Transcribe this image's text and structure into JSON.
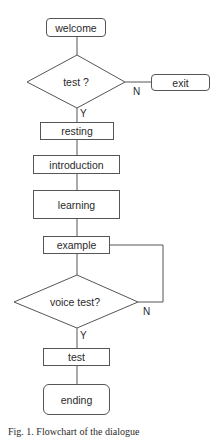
{
  "flowchart": {
    "nodes": {
      "welcome": "welcome",
      "test_decision": "test ?",
      "exit": "exit",
      "resting": "resting",
      "introduction": "introduction",
      "learning": "learning",
      "example": "example",
      "voice_test_decision": "voice test?",
      "test": "test",
      "ending": "ending"
    },
    "edge_labels": {
      "test_no": "N",
      "test_yes": "Y",
      "voice_no": "N",
      "voice_yes": "Y"
    },
    "edges": [
      {
        "from": "welcome",
        "to": "test ?"
      },
      {
        "from": "test ?",
        "to": "exit",
        "label": "N"
      },
      {
        "from": "test ?",
        "to": "resting",
        "label": "Y"
      },
      {
        "from": "resting",
        "to": "introduction"
      },
      {
        "from": "introduction",
        "to": "learning"
      },
      {
        "from": "learning",
        "to": "example"
      },
      {
        "from": "example",
        "to": "voice test?"
      },
      {
        "from": "voice test?",
        "to": "example",
        "label": "N"
      },
      {
        "from": "voice test?",
        "to": "test",
        "label": "Y"
      },
      {
        "from": "test",
        "to": "ending"
      }
    ]
  },
  "caption": "Fig. 1. Flowchart of the dialogue"
}
